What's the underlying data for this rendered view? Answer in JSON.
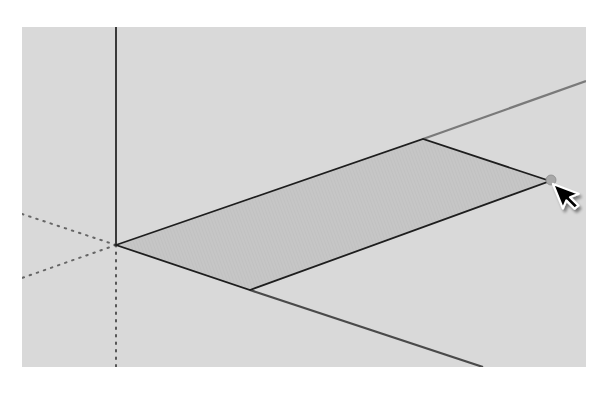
{
  "app": {
    "type": "3d-modeling-viewport",
    "tool_state": "drawing-rectangle"
  },
  "viewport": {
    "bounds": {
      "x": 22,
      "y": 27,
      "width": 564,
      "height": 340
    },
    "background_color": "#d9d9d9"
  },
  "axes": {
    "origin": {
      "x": 116,
      "y": 245
    },
    "blue_solid": {
      "from": {
        "x": 116,
        "y": 27
      },
      "to": {
        "x": 116,
        "y": 245
      },
      "color": "#3a3a3a"
    },
    "blue_dotted": {
      "from": {
        "x": 116,
        "y": 245
      },
      "to": {
        "x": 116,
        "y": 367
      },
      "color": "#555555"
    },
    "green_solid": {
      "from": {
        "x": 423,
        "y": 139
      },
      "to": {
        "x": 586,
        "y": 81
      },
      "color": "#7a7a7a"
    },
    "green_dotted": {
      "from": {
        "x": 116,
        "y": 245
      },
      "to": {
        "x": 22,
        "y": 278
      },
      "color": "#666666"
    },
    "red_solid": {
      "from": {
        "x": 250,
        "y": 290
      },
      "to": {
        "x": 483,
        "y": 367
      },
      "color": "#4a4a4a"
    },
    "red_dotted": {
      "from": {
        "x": 116,
        "y": 245
      },
      "to": {
        "x": 22,
        "y": 214
      },
      "color": "#666666"
    }
  },
  "rectangle_face": {
    "vertices": [
      {
        "x": 116,
        "y": 245
      },
      {
        "x": 423,
        "y": 139
      },
      {
        "x": 550,
        "y": 181
      },
      {
        "x": 250,
        "y": 290
      }
    ],
    "fill_color": "#c4c4c4",
    "edge_color": "#1e1e1e"
  },
  "inference_point": {
    "center": {
      "x": 551,
      "y": 180
    },
    "radius": 5,
    "color": "#a8a8a8"
  },
  "cursor": {
    "icon": "arrow-pointer-icon",
    "tip": {
      "x": 553,
      "y": 184
    },
    "fill_color": "#000000",
    "outline_color": "#ffffff"
  }
}
